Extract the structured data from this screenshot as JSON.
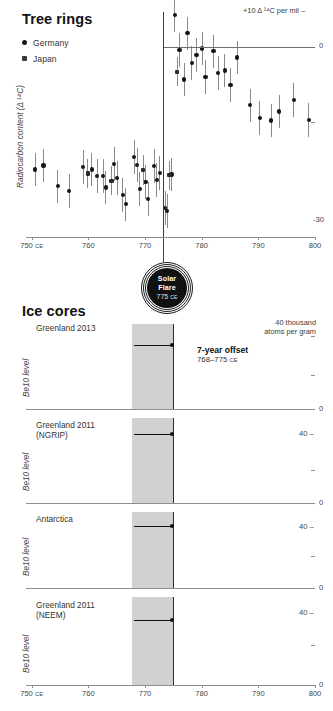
{
  "tree": {
    "title": "Tree rings",
    "ylabel": "Radiocarbon content (Δ ¹⁴C)",
    "top_right_label": "+10 Δ ¹⁴C per mil",
    "bottom_right_label": "-30",
    "zero_label": "0",
    "legend": [
      {
        "label": "Germany",
        "marker": "circle"
      },
      {
        "label": "Japan",
        "marker": "square"
      }
    ],
    "xticks": [
      "750",
      "760",
      "770",
      "780",
      "790",
      "800"
    ],
    "xtick_suffix": "CE"
  },
  "flare": {
    "line1": "Solar",
    "line2": "Flare",
    "year": "775",
    "year_suffix": "CE"
  },
  "ice": {
    "title": "Ice cores",
    "ylabel": "Be10 level",
    "unit_label_line1": "40 thousand",
    "unit_label_line2": "atoms per gram",
    "zero_label": "0",
    "forty_label": "40",
    "annotation": {
      "headline": "7-year offset",
      "range": "768–775",
      "range_suffix": "CE"
    },
    "xticks": [
      "750",
      "760",
      "770",
      "780",
      "790",
      "800"
    ],
    "xtick_suffix": "CE",
    "panels": [
      {
        "name": "Greenland 2013",
        "sub": ""
      },
      {
        "name": "Greenland 2011",
        "sub": "(NGRIP)"
      },
      {
        "name": "Antarctica",
        "sub": ""
      },
      {
        "name": "Greenland 2011",
        "sub": "(NEEM)"
      }
    ]
  },
  "chart_data": [
    {
      "type": "scatter",
      "title": "Tree rings",
      "xlabel": "Year (CE)",
      "ylabel": "Radiocarbon content (Δ 14C)",
      "xlim": [
        749,
        800
      ],
      "ylim": [
        -30,
        10
      ],
      "grid": false,
      "legend_position": "top-left",
      "annotations": [
        "Solar Flare 775 CE",
        "+10 Δ 14C per mil",
        "0",
        "-30"
      ],
      "series": [
        {
          "name": "Germany",
          "marker": "circle",
          "points": [
            {
              "x": 750.5,
              "y": -18.0,
              "err": 3.0
            },
            {
              "x": 752.0,
              "y": -17.3,
              "err": 3.0
            },
            {
              "x": 754.5,
              "y": -21.0,
              "err": 3.0
            },
            {
              "x": 756.5,
              "y": -21.8,
              "err": 3.0
            },
            {
              "x": 759.0,
              "y": -17.5,
              "err": 3.0
            },
            {
              "x": 760.5,
              "y": -18.0,
              "err": 3.0
            },
            {
              "x": 761.5,
              "y": -19.1,
              "err": 3.0
            },
            {
              "x": 762.5,
              "y": -19.1,
              "err": 3.0
            },
            {
              "x": 763.0,
              "y": -21.2,
              "err": 3.0
            },
            {
              "x": 764.5,
              "y": -17.0,
              "err": 3.0
            },
            {
              "x": 765.0,
              "y": -19.5,
              "err": 3.0
            },
            {
              "x": 766.0,
              "y": -22.5,
              "err": 3.0
            },
            {
              "x": 766.5,
              "y": -24.2,
              "err": 3.0
            },
            {
              "x": 768.0,
              "y": -15.8,
              "err": 3.0
            },
            {
              "x": 768.5,
              "y": -17.2,
              "err": 3.0
            },
            {
              "x": 769.0,
              "y": -21.4,
              "err": 3.0
            },
            {
              "x": 770.0,
              "y": -20.2,
              "err": 3.0
            },
            {
              "x": 770.5,
              "y": -23.2,
              "err": 3.0
            },
            {
              "x": 771.5,
              "y": -17.4,
              "err": 3.0
            },
            {
              "x": 772.0,
              "y": -19.8,
              "err": 3.0
            },
            {
              "x": 772.5,
              "y": -18.6,
              "err": 3.0
            },
            {
              "x": 773.5,
              "y": -24.8,
              "err": 3.0
            },
            {
              "x": 773.8,
              "y": -25.4,
              "err": 3.0
            },
            {
              "x": 774.6,
              "y": -18.9,
              "err": 3.0
            },
            {
              "x": 775.2,
              "y": 9.4,
              "err": 3.0
            },
            {
              "x": 776.0,
              "y": 3.2,
              "err": 3.0
            },
            {
              "x": 776.8,
              "y": -2.0,
              "err": 3.0
            },
            {
              "x": 777.4,
              "y": 6.2,
              "err": 3.0
            },
            {
              "x": 778.2,
              "y": 1.0,
              "err": 3.0
            },
            {
              "x": 779.0,
              "y": 2.4,
              "err": 3.0
            },
            {
              "x": 780.0,
              "y": 3.5,
              "err": 3.0
            },
            {
              "x": 780.6,
              "y": -1.6,
              "err": 3.0
            },
            {
              "x": 782.0,
              "y": 3.0,
              "err": 3.0
            },
            {
              "x": 782.8,
              "y": -0.8,
              "err": 3.0
            },
            {
              "x": 784.0,
              "y": -0.4,
              "err": 3.0
            },
            {
              "x": 785.0,
              "y": -3.0,
              "err": 3.0
            },
            {
              "x": 786.2,
              "y": 1.9,
              "err": 3.0
            },
            {
              "x": 788.5,
              "y": -6.6,
              "err": 3.0
            },
            {
              "x": 790.2,
              "y": -8.9,
              "err": 3.0
            },
            {
              "x": 792.2,
              "y": -9.3,
              "err": 3.0
            },
            {
              "x": 793.6,
              "y": -7.7,
              "err": 3.0
            },
            {
              "x": 796.2,
              "y": -5.6,
              "err": 3.0
            },
            {
              "x": 798.8,
              "y": -9.2,
              "err": 3.0
            }
          ]
        },
        {
          "name": "Japan",
          "marker": "square",
          "points": [
            {
              "x": 759.8,
              "y": -18.7,
              "err": 2.6
            },
            {
              "x": 764.0,
              "y": -20.0,
              "err": 2.6
            },
            {
              "x": 769.6,
              "y": -18.1,
              "err": 2.6
            },
            {
              "x": 774.2,
              "y": -19.0,
              "err": 2.6
            },
            {
              "x": 775.6,
              "y": -0.6,
              "err": 2.6
            }
          ]
        }
      ]
    },
    {
      "type": "bar",
      "title": "Greenland 2013",
      "ylabel": "Be10 level",
      "xlabel": "Year (CE)",
      "xlim": [
        749,
        800
      ],
      "ylim": [
        0,
        40
      ],
      "grid": false,
      "highlight_band": [
        768,
        775
      ],
      "highlight_bar_year": 768,
      "annotation": "7-year offset 768-775 CE",
      "x": [
        764,
        765,
        766,
        767,
        768,
        769
      ],
      "values": [
        20,
        18,
        19,
        25,
        39,
        31
      ]
    },
    {
      "type": "bar",
      "title": "Greenland 2011 (NGRIP)",
      "ylabel": "Be10 level",
      "xlabel": "Year (CE)",
      "xlim": [
        749,
        800
      ],
      "ylim": [
        0,
        40
      ],
      "grid": false,
      "highlight_band": [
        768,
        775
      ],
      "highlight_bar_year": 768,
      "x": [
        763,
        764,
        765,
        766,
        767,
        768,
        769,
        770,
        771,
        772,
        773,
        774,
        775,
        776,
        777,
        778,
        779,
        780,
        781,
        782,
        783,
        784,
        785,
        786,
        787,
        788,
        789,
        790,
        791,
        792,
        793,
        794,
        795,
        796,
        797
      ],
      "values": [
        17,
        16,
        15,
        16,
        17,
        36,
        34,
        27,
        21,
        18,
        17,
        18,
        20,
        23,
        23,
        24,
        22,
        20,
        23,
        24,
        22,
        19,
        19,
        18,
        17,
        15,
        17,
        20,
        22,
        23,
        21,
        20,
        22,
        22,
        18
      ]
    },
    {
      "type": "bar",
      "title": "Antarctica",
      "ylabel": "Be10 level",
      "xlabel": "Year (CE)",
      "xlim": [
        749,
        800
      ],
      "ylim": [
        0,
        40
      ],
      "grid": false,
      "highlight_band": [
        768,
        775
      ],
      "highlight_bar_year": 768,
      "x": [
        750,
        751,
        752,
        753,
        754,
        755,
        756,
        757,
        758,
        759,
        760,
        761,
        762,
        763,
        764,
        765,
        766,
        767,
        768,
        769,
        770,
        771,
        772,
        773,
        774,
        775,
        776,
        777,
        778,
        779,
        780,
        781,
        782,
        783,
        784,
        785,
        786,
        787,
        788,
        789,
        790,
        791,
        792,
        793,
        794,
        795,
        796,
        797,
        798,
        799
      ],
      "values": [
        8,
        9,
        8,
        9,
        8,
        9,
        8,
        9,
        8,
        9,
        9,
        8,
        9,
        8,
        9,
        8,
        9,
        9,
        35,
        26,
        19,
        15,
        12,
        13,
        13,
        12,
        12,
        16,
        14,
        13,
        12,
        11,
        10,
        9,
        10,
        11,
        13,
        12,
        12,
        11,
        12,
        11,
        13,
        18,
        16,
        14,
        13,
        15,
        14,
        12
      ],
      "note": "bars partly clipped at panel bottom"
    },
    {
      "type": "bar",
      "title": "Greenland 2011 (NEEM)",
      "ylabel": "Be10 level",
      "xlabel": "Year (CE)",
      "xlim": [
        749,
        800
      ],
      "ylim": [
        0,
        40
      ],
      "grid": false,
      "highlight_band": [
        768,
        775
      ],
      "highlight_bar_year": 768,
      "x": [
        750,
        751,
        752,
        753,
        754,
        755,
        756,
        757,
        758,
        759,
        760,
        761,
        762,
        763,
        764,
        765,
        766,
        767,
        768,
        769,
        770,
        771,
        772,
        773,
        774,
        775,
        776,
        777,
        778,
        779,
        780,
        781,
        785,
        786,
        787,
        788,
        789,
        790,
        791,
        792,
        793,
        794,
        795
      ],
      "values": [
        11,
        13,
        14,
        12,
        11,
        10,
        12,
        11,
        10,
        9,
        12,
        11,
        12,
        11,
        10,
        9,
        20,
        12,
        39,
        13,
        16,
        11,
        12,
        14,
        15,
        12,
        13,
        11,
        12,
        13,
        14,
        12,
        11,
        12,
        13,
        13,
        12,
        11,
        13,
        15,
        16,
        14,
        13
      ],
      "note": "data gap between 782 and 784"
    }
  ]
}
